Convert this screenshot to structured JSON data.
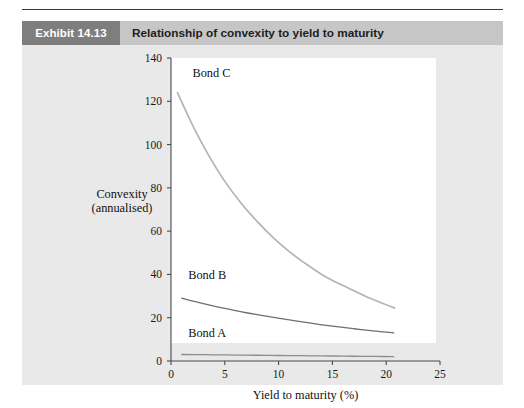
{
  "exhibit": {
    "badge_label": "Exhibit 14.13",
    "title": "Relationship of convexity to yield to maturity"
  },
  "colors": {
    "badge_bg": "#7e7e7e",
    "header_bg": "#c6c6c6",
    "panel_bg": "#e9e9e9",
    "plot_bg": "#ffffff",
    "axis": "#4a4a4a",
    "bond_a_line": "#8d8d8d",
    "bond_b_line": "#6f6f6f",
    "bond_c_line": "#b4b4b4"
  },
  "chart_data": {
    "type": "line",
    "title": "Relationship of convexity to yield to maturity",
    "xlabel": "Yield to maturity (%)",
    "ylabel": "Convexity (annualised)",
    "ylabel_lines": [
      "Convexity",
      "(annualised)"
    ],
    "xlim": [
      0,
      25
    ],
    "ylim": [
      0,
      140
    ],
    "xticks": [
      0,
      5,
      10,
      15,
      20,
      25
    ],
    "xtick_labels": [
      "0",
      "5",
      "10",
      "15",
      "20",
      "25"
    ],
    "yticks": [
      0,
      20,
      40,
      60,
      80,
      100,
      120,
      140
    ],
    "ytick_labels": [
      "0",
      "20",
      "40",
      "60",
      "80",
      "100",
      "120",
      "140"
    ],
    "grid": false,
    "legend": "inline-annotations",
    "series": [
      {
        "name": "Bond A",
        "label_x": 1.6,
        "label_y": 11,
        "color": "#8d8d8d",
        "x": [
          1.0,
          3.0,
          5.0,
          7.0,
          9.0,
          11.0,
          13.0,
          15.0,
          17.0,
          19.0,
          20.7
        ],
        "values": [
          3.0,
          2.9,
          2.8,
          2.7,
          2.6,
          2.5,
          2.4,
          2.3,
          2.2,
          2.1,
          2.0
        ]
      },
      {
        "name": "Bond B",
        "label_x": 1.6,
        "label_y": 38,
        "color": "#6f6f6f",
        "x": [
          1.0,
          3.0,
          5.0,
          7.0,
          9.0,
          11.0,
          13.0,
          15.0,
          17.0,
          19.0,
          20.7
        ],
        "values": [
          29.0,
          26.5,
          24.3,
          22.3,
          20.6,
          19.0,
          17.5,
          16.1,
          14.9,
          13.8,
          13.0
        ]
      },
      {
        "name": "Bond C",
        "label_x": 2.0,
        "label_y": 131,
        "color": "#b4b4b4",
        "x": [
          0.6,
          2.0,
          3.5,
          5.0,
          6.5,
          8.0,
          9.5,
          11.0,
          12.5,
          14.0,
          15.5,
          17.0,
          18.5,
          20.0,
          20.8
        ],
        "values": [
          124.0,
          109.0,
          95.0,
          83.0,
          73.0,
          64.5,
          57.0,
          50.5,
          45.0,
          40.0,
          36.0,
          32.5,
          29.0,
          26.0,
          24.5
        ]
      }
    ]
  }
}
